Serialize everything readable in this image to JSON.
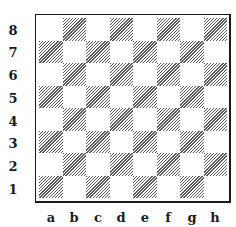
{
  "board": {
    "ranks": [
      "8",
      "7",
      "6",
      "5",
      "4",
      "3",
      "2",
      "1"
    ],
    "files": [
      "a",
      "b",
      "c",
      "d",
      "e",
      "f",
      "g",
      "h"
    ],
    "top_left_square_color": "light",
    "dark_square_style": "diagonal-hatch",
    "colors": {
      "border": "#1a1a1a",
      "hatch": "#5a5a5a",
      "light": "#ffffff"
    }
  }
}
